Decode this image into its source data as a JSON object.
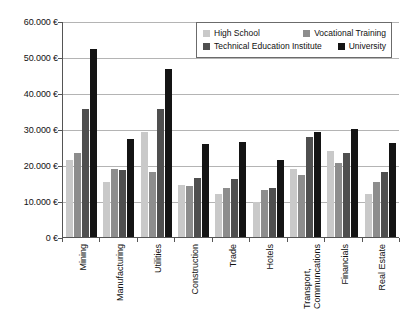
{
  "chart_data": {
    "type": "bar",
    "title": "",
    "subtitle": "",
    "xlabel": "",
    "ylabel": "",
    "ylim": [
      0,
      60000
    ],
    "grid": true,
    "legend_position": "top-right",
    "y_ticks": [
      0,
      10000,
      20000,
      30000,
      40000,
      50000,
      60000
    ],
    "y_tick_labels": [
      "0 €",
      "10.000 €",
      "20.000 €",
      "30.000 €",
      "40.000 €",
      "50.000 €",
      "60.000 €"
    ],
    "categories": [
      "Mining",
      "Manufacturing",
      "Utilities",
      "Construction",
      "Trade",
      "Hotels",
      "Transport,\nCommuncations",
      "Financials",
      "Real Estate"
    ],
    "series": [
      {
        "name": "High School",
        "color": "#c9c9c9",
        "values": [
          21400,
          15200,
          29200,
          14500,
          11900,
          9800,
          18900,
          24000,
          11900
        ]
      },
      {
        "name": "Vocational Training",
        "color": "#8d8d8d",
        "values": [
          23300,
          19000,
          18000,
          14200,
          13500,
          13100,
          17100,
          20600,
          15400
        ]
      },
      {
        "name": "Technical Education Institute",
        "color": "#4f4f4f",
        "values": [
          35500,
          18500,
          35500,
          16400,
          16100,
          13700,
          27900,
          23200,
          18000
        ]
      },
      {
        "name": "University",
        "color": "#141414",
        "values": [
          52300,
          27200,
          46800,
          25700,
          26300,
          21300,
          29200,
          29900,
          26200
        ]
      }
    ]
  },
  "legend": {
    "entries": [
      {
        "label": "High School",
        "color": "#c9c9c9"
      },
      {
        "label": "Vocational Training",
        "color": "#8d8d8d"
      },
      {
        "label": "Technical Education Institute",
        "color": "#4f4f4f"
      },
      {
        "label": "University",
        "color": "#141414"
      }
    ]
  },
  "colors": {
    "axis": "#555555",
    "grid": "#b4b4b4",
    "background": "#ffffff",
    "text": "#111111"
  }
}
